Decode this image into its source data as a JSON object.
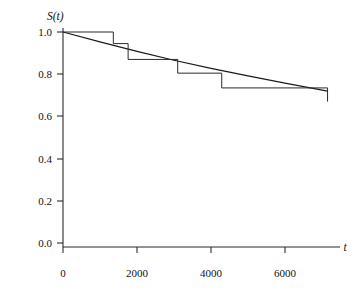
{
  "chart_data": {
    "type": "line",
    "title": "",
    "xlabel": "t",
    "ylabel": "S(t)",
    "xlim": [
      0,
      7100
    ],
    "ylim": [
      0.0,
      1.0
    ],
    "grid": false,
    "legend": null,
    "xticks": [
      0,
      2000,
      4000,
      6000
    ],
    "xtick_labels": [
      "0",
      "2000",
      "4000",
      "6000"
    ],
    "yticks": [
      0.0,
      0.2,
      0.4,
      0.6,
      0.8,
      1.0
    ],
    "ytick_labels": [
      "0.0",
      "0.2",
      "0.4",
      "0.6",
      "0.8",
      "1.0"
    ],
    "series": [
      {
        "name": "Kaplan-Meier step estimate",
        "style": "step",
        "x": [
          0,
          1360,
          1760,
          3100,
          4290,
          7150
        ],
        "values": [
          1.0,
          0.945,
          0.87,
          0.805,
          0.735,
          0.67
        ],
        "steps": [
          {
            "t_start": 0,
            "t_end": 1360,
            "S": 1.0
          },
          {
            "t_start": 1360,
            "t_end": 1760,
            "S": 0.945
          },
          {
            "t_start": 1760,
            "t_end": 3100,
            "S": 0.87
          },
          {
            "t_start": 3100,
            "t_end": 4290,
            "S": 0.805
          },
          {
            "t_start": 4290,
            "t_end": 7150,
            "S": 0.735
          },
          {
            "t_start": 7150,
            "t_end": 7150,
            "S": 0.67
          }
        ]
      },
      {
        "name": "Fitted smooth survival curve",
        "style": "smooth",
        "x": [
          0,
          1000,
          2000,
          3000,
          4000,
          5000,
          6000,
          7150
        ],
        "values": [
          1.0,
          0.953,
          0.908,
          0.866,
          0.828,
          0.792,
          0.758,
          0.72
        ]
      }
    ]
  },
  "axes": {
    "y_label_text": "S(t)",
    "x_label_text": "t"
  },
  "colors": {
    "axis": "#2b2b2b",
    "step_curve": "#2b2b2b",
    "fit_curve": "#1a1a1a",
    "background": "#ffffff"
  }
}
